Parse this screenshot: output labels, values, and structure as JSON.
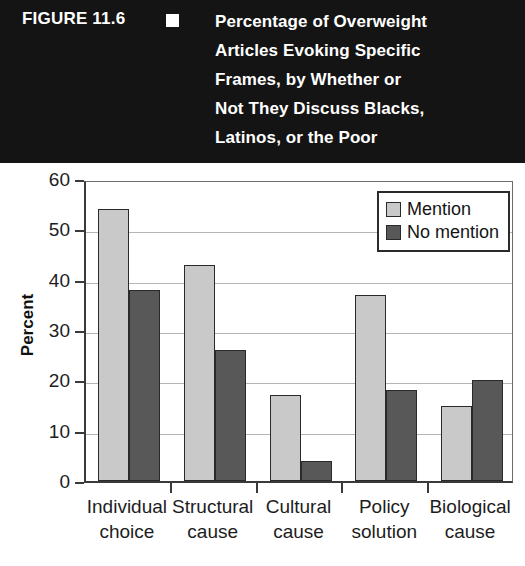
{
  "header": {
    "figure_number": "FIGURE 11.6",
    "bullet_icon": "filled-square-icon",
    "title_lines": [
      "Percentage of Overweight",
      "Articles Evoking Specific",
      "Frames, by Whether or",
      "Not They Discuss Blacks,",
      "Latinos, or the Poor"
    ],
    "background_color": "#141414",
    "text_color": "#ffffff"
  },
  "chart_data": {
    "type": "bar",
    "title": "Percentage of Overweight Articles Evoking Specific Frames, by Whether or Not They Discuss Blacks, Latinos, or the Poor",
    "xlabel": "",
    "ylabel": "Percent",
    "categories": [
      "Individual choice",
      "Structural cause",
      "Cultural cause",
      "Policy solution",
      "Biological cause"
    ],
    "category_lines": [
      [
        "Individual",
        "choice"
      ],
      [
        "Structural",
        "cause"
      ],
      [
        "Cultural",
        "cause"
      ],
      [
        "Policy",
        "solution"
      ],
      [
        "Biological",
        "cause"
      ]
    ],
    "series": [
      {
        "name": "Mention",
        "color": "#c9c9c9",
        "values": [
          54,
          43,
          17,
          37,
          15
        ]
      },
      {
        "name": "No mention",
        "color": "#585858",
        "values": [
          38,
          26,
          4,
          18,
          20
        ]
      }
    ],
    "ylim": [
      0,
      60
    ],
    "yticks": [
      0,
      10,
      20,
      30,
      40,
      50,
      60
    ],
    "ytick_labels": [
      "0",
      "10",
      "20",
      "30",
      "40",
      "50",
      "60"
    ],
    "grid": true,
    "grid_axis": "y",
    "legend_position": "top-right",
    "legend_entries": [
      "Mention",
      "No mention"
    ]
  }
}
